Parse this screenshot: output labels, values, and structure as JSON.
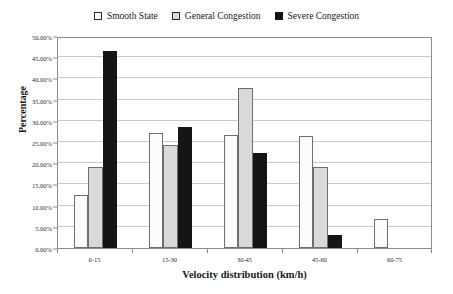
{
  "chart_data": {
    "type": "bar",
    "title": "",
    "xlabel": "Velocity distribution (km/h)",
    "ylabel": "Percentage",
    "categories": [
      "0-15",
      "15-30",
      "30-45",
      "45-60",
      "60-75"
    ],
    "series": [
      {
        "name": "Smooth State",
        "color": "#ffffff",
        "values": [
          12.5,
          27.1,
          26.7,
          26.5,
          6.9
        ]
      },
      {
        "name": "General Congestion",
        "color": "#d9d9d9",
        "values": [
          19.0,
          24.2,
          37.8,
          19.0,
          0.0
        ]
      },
      {
        "name": "Severe Congestion",
        "color": "#121212",
        "values": [
          46.5,
          28.6,
          22.5,
          3.1,
          0.0
        ]
      }
    ],
    "ylim": [
      0,
      50
    ],
    "ytick_values": [
      0,
      5,
      10,
      15,
      20,
      25,
      30,
      35,
      40,
      45,
      50
    ],
    "ytick_labels": [
      "0.00%",
      "5.00%",
      "10.00%",
      "15.00%",
      "20.00%",
      "25.00%",
      "30.00%",
      "35.00%",
      "40.00%",
      "45.00%",
      "50.00%"
    ],
    "grid": true,
    "legend_position": "top-center"
  },
  "legend": {
    "items": [
      {
        "label": "Smooth State"
      },
      {
        "label": "General Congestion"
      },
      {
        "label": "Severe Congestion"
      }
    ]
  },
  "axes": {
    "y_title": "Percentage",
    "x_title": "Velocity distribution (km/h)"
  }
}
